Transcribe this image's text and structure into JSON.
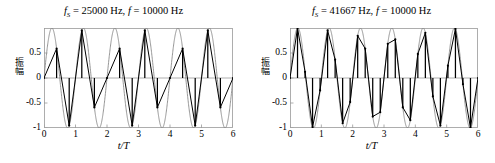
{
  "figure": {
    "background": "#ffffff",
    "ink": "#000000",
    "curve_color": "#8a8a8a",
    "frame_color": "#9a9a9a"
  },
  "panels": [
    {
      "id": "left",
      "title_prefix": "f",
      "title_sub": "S",
      "title_rest": " = 25000 Hz, ",
      "title_f": "f",
      "title_f_rest": " = 10000 Hz",
      "title_text": "fS = 25000 Hz, f = 10000 Hz",
      "ylabel": "振幅",
      "xlabel": "t/T",
      "yticks": [
        "0.5",
        "0",
        "-0.5",
        "-1"
      ],
      "xticks": [
        "0",
        "1",
        "2",
        "3",
        "4",
        "5",
        "6"
      ]
    },
    {
      "id": "right",
      "title_prefix": "f",
      "title_sub": "S",
      "title_rest": " = 41667 Hz, ",
      "title_f": "f",
      "title_f_rest": " = 10000 Hz",
      "title_text": "fS = 41667 Hz, f = 10000 Hz",
      "ylabel": "振幅",
      "xlabel": "t/T",
      "yticks": [
        "0.5",
        "0",
        "-0.5",
        "-1"
      ],
      "xticks": [
        "0",
        "1",
        "2",
        "3",
        "4",
        "5",
        "6"
      ]
    }
  ],
  "chart_data": [
    {
      "type": "line",
      "id": "left",
      "title": "f_S = 25000 Hz, f = 10000 Hz",
      "xlabel": "t/T",
      "ylabel": "振幅",
      "xlim": [
        0,
        6
      ],
      "ylim": [
        -1,
        1
      ],
      "yticks": [
        0.5,
        0,
        -0.5,
        -1
      ],
      "xticks": [
        0,
        1,
        2,
        3,
        4,
        5,
        6
      ],
      "grid": false,
      "legend": "none",
      "signal_frequency_hz": 10000,
      "sampling_frequency_hz": 25000,
      "samples_per_cycle": 2.5,
      "series": [
        {
          "name": "original sine",
          "role": "continuous",
          "color": "#8a8a8a",
          "equation": "sin(2*pi*x)",
          "samples_per_unit": 200
        },
        {
          "name": "sampled reconstruction",
          "role": "sampled-linear",
          "color": "#000000",
          "equation": "sin(2*pi*x)",
          "sample_step": 0.4,
          "stems": true
        }
      ]
    },
    {
      "type": "line",
      "id": "right",
      "title": "f_S = 41667 Hz, f = 10000 Hz",
      "xlabel": "t/T",
      "ylabel": "振幅",
      "xlim": [
        0,
        6
      ],
      "ylim": [
        -1,
        1
      ],
      "yticks": [
        0.5,
        0,
        -0.5,
        -1
      ],
      "xticks": [
        0,
        1,
        2,
        3,
        4,
        5,
        6
      ],
      "grid": false,
      "legend": "none",
      "signal_frequency_hz": 10000,
      "sampling_frequency_hz": 41667,
      "samples_per_cycle": 4.1667,
      "series": [
        {
          "name": "original sine",
          "role": "continuous",
          "color": "#8a8a8a",
          "equation": "sin(2*pi*x)",
          "samples_per_unit": 200
        },
        {
          "name": "sampled reconstruction",
          "role": "sampled-linear",
          "color": "#000000",
          "equation": "sin(2*pi*x)",
          "sample_step": 0.24,
          "stems": true
        }
      ]
    }
  ]
}
